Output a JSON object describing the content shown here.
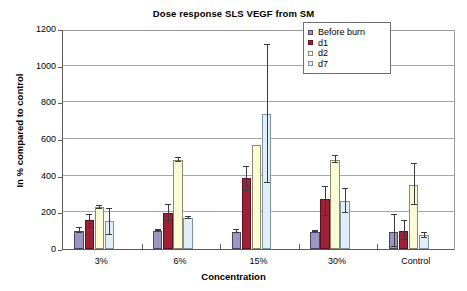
{
  "chart_data": {
    "type": "bar",
    "title": "Dose response SLS VEGF from SM",
    "xlabel": "Concentration",
    "ylabel": "In % compared to control",
    "categories": [
      "3%",
      "6%",
      "15%",
      "30%",
      "Control"
    ],
    "ylim": [
      0,
      1200
    ],
    "yticks": [
      0,
      200,
      400,
      600,
      800,
      1000,
      1200
    ],
    "grid": "horizontal",
    "legend_position": "top-right-inside",
    "series": [
      {
        "name": "Before burn",
        "color": "#9b96c4",
        "values": [
          100,
          100,
          95,
          95,
          95
        ],
        "err_low": [
          88,
          96,
          86,
          91,
          10
        ],
        "err_high": [
          115,
          104,
          104,
          99,
          185
        ]
      },
      {
        "name": "d1",
        "color": "#9e2137",
        "values": [
          157,
          197,
          390,
          275,
          100
        ],
        "err_low": [
          113,
          153,
          315,
          180,
          50
        ],
        "err_high": [
          185,
          240,
          450,
          340,
          155
        ]
      },
      {
        "name": "d2",
        "color": "#fbfbd6",
        "values": [
          227,
          483,
          567,
          487,
          350
        ],
        "err_low": [
          220,
          472,
          567,
          468,
          240
        ],
        "err_high": [
          234,
          495,
          567,
          505,
          465
        ]
      },
      {
        "name": "d7",
        "color": "#e2eef5",
        "values": [
          155,
          168,
          737,
          262,
          75
        ],
        "err_low": [
          78,
          162,
          360,
          195,
          62
        ],
        "err_high": [
          218,
          174,
          1115,
          330,
          90
        ]
      }
    ]
  }
}
